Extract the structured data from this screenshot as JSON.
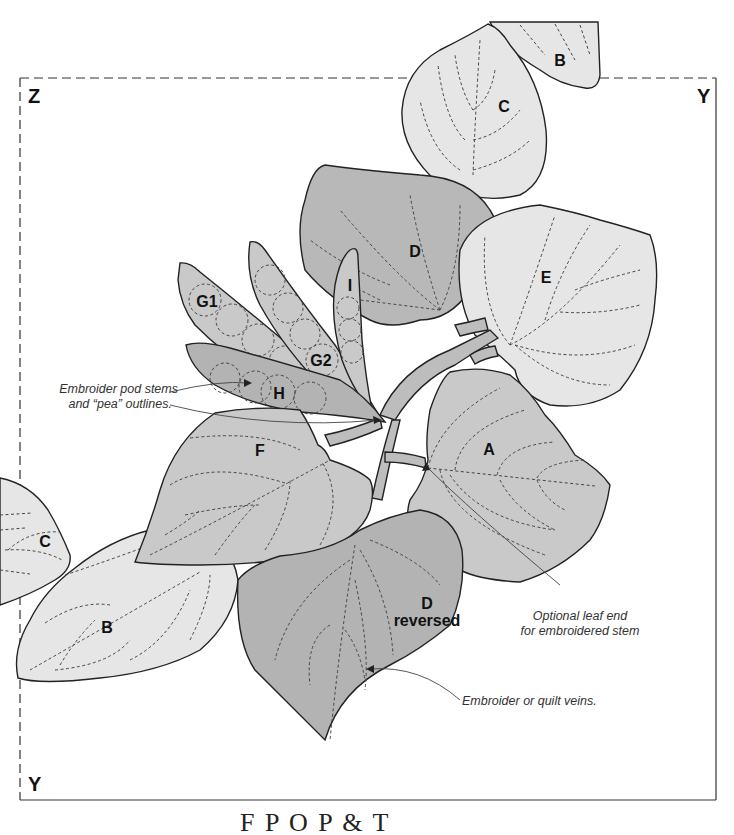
{
  "diagram": {
    "type": "quilt-applique-placement-pattern",
    "corner_labels": {
      "top_left": "Z",
      "top_right": "Y",
      "bottom_left": "Y"
    },
    "colors": {
      "light_fill": "#e6e6e6",
      "medium_fill": "#c9c9c9",
      "dark_fill": "#b3b3b3",
      "stem_fill": "#bdbdbd",
      "outline": "#222222",
      "vein": "#444444"
    },
    "pieces": [
      {
        "id": "A",
        "label": "A",
        "shade": "medium"
      },
      {
        "id": "B-top",
        "label": "B",
        "shade": "light"
      },
      {
        "id": "B-bottom",
        "label": "B",
        "shade": "light"
      },
      {
        "id": "C-top",
        "label": "C",
        "shade": "light"
      },
      {
        "id": "C-left",
        "label": "C",
        "shade": "light"
      },
      {
        "id": "D",
        "label": "D",
        "shade": "dark"
      },
      {
        "id": "D-reversed",
        "label_line1": "D",
        "label_line2": "reversed",
        "shade": "dark"
      },
      {
        "id": "E",
        "label": "E",
        "shade": "light"
      },
      {
        "id": "F",
        "label": "F",
        "shade": "medium"
      },
      {
        "id": "G1",
        "label": "G1",
        "shade": "medium"
      },
      {
        "id": "G2",
        "label": "G2",
        "shade": "medium"
      },
      {
        "id": "H",
        "label": "H",
        "shade": "dark"
      },
      {
        "id": "I",
        "label": "I",
        "shade": "medium"
      }
    ],
    "annotations": {
      "pod_note_line1": "Embroider pod stems",
      "pod_note_line2": "and “pea” outlines.",
      "leaf_end_note_line1": "Optional leaf end",
      "leaf_end_note_line2": "for embroidered stem",
      "veins_note": "Embroider or quilt veins."
    },
    "footer_title_partial": "F  P  O  P & T"
  }
}
